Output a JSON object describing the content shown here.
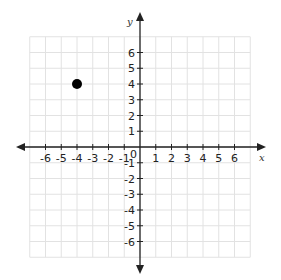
{
  "chart_data": {
    "type": "scatter",
    "title": "",
    "xlabel": "x",
    "ylabel": "y",
    "xlim": [
      -7,
      7
    ],
    "ylim": [
      -7,
      7
    ],
    "grid": true,
    "origin_label": "0",
    "x_ticks": [
      -6,
      -5,
      -4,
      -3,
      -2,
      -1,
      1,
      2,
      3,
      4,
      5,
      6
    ],
    "y_ticks": [
      6,
      5,
      4,
      3,
      2,
      1,
      -1,
      -2,
      -3,
      -4,
      -5,
      -6
    ],
    "series": [
      {
        "name": "point",
        "points": [
          {
            "x": -4,
            "y": 4
          }
        ],
        "color": "#000000"
      }
    ]
  },
  "colors": {
    "axis": "#222222",
    "grid": "#e2e2e2",
    "point": "#000000"
  }
}
